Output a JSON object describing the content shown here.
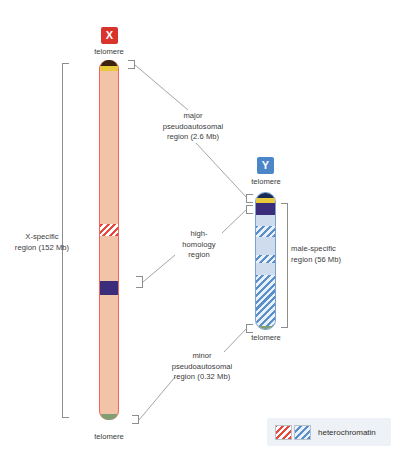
{
  "figure": {
    "title_x_badge": "X",
    "title_y_badge": "Y"
  },
  "labels": {
    "telomere": "telomere",
    "x_specific": "X-specific\nregion (152 Mb)",
    "major_pseudoautosomal": "major\npseudoautosomal\nregion (2.6 Mb)",
    "high_homology": "high-\nhomology\nregion",
    "minor_pseudoautosomal": "minor\npseudoautosomal\nregion (0.32 Mb)",
    "male_specific": "male-specific\nregion (56 Mb)"
  },
  "telomere_labels": {
    "x_top": "telomere",
    "x_bottom": "telomere",
    "y_top": "telomere",
    "y_bottom": "telomere"
  },
  "legend": {
    "text": "heterochromatin",
    "swatch_red_name": "red-hatch-swatch",
    "swatch_blue_name": "blue-hatch-swatch"
  },
  "colors": {
    "x_badge": "#d9342b",
    "y_badge": "#4a86c8",
    "x_body": "#f2c3a6",
    "x_outline": "#e8685f",
    "y_body": "#cfdcee",
    "y_outline": "#7ba2cf",
    "heterochromatin_red": "#e8473c",
    "heterochromatin_blue": "#5b8fc9",
    "dark_band": "#3b2d7a",
    "gold_band": "#e8c93c",
    "telomere_cap_dark": "#3a2410",
    "telomere_cap_green": "#7f9e74",
    "bracket": "#8d8d8d",
    "legend_bg": "#eef1f5"
  },
  "chromosomes": {
    "x": {
      "name": "X chromosome",
      "length_mb": 155,
      "bands": [
        {
          "name": "top-telomere-cap",
          "color": "#3a2410",
          "y_pct": 0,
          "h_pct": 1.6
        },
        {
          "name": "gold-band",
          "color": "#e8c93c",
          "y_pct": 1.6,
          "h_pct": 1.4
        },
        {
          "name": "heterochromatin-hatch",
          "color": "#e8473c",
          "y_pct": 45.5,
          "h_pct": 3.4
        },
        {
          "name": "dark-band",
          "color": "#3b2d7a",
          "y_pct": 61.5,
          "h_pct": 4.0
        },
        {
          "name": "bottom-telomere-cap",
          "color": "#7f9e74",
          "y_pct": 98.6,
          "h_pct": 1.4
        }
      ]
    },
    "y": {
      "name": "Y chromosome",
      "length_mb": 59,
      "bands": [
        {
          "name": "top-telomere-cap",
          "color": "#1a2a57",
          "y_pct": 0,
          "h_pct": 3.0
        },
        {
          "name": "gold-band",
          "color": "#e8c93c",
          "y_pct": 3.0,
          "h_pct": 3.4
        },
        {
          "name": "dark-band",
          "color": "#3b2d7a",
          "y_pct": 6.4,
          "h_pct": 8.5
        },
        {
          "name": "heterochromatin-hatch-1",
          "color": "#5b8fc9",
          "y_pct": 23.0,
          "h_pct": 7.5
        },
        {
          "name": "heterochromatin-hatch-2",
          "color": "#5b8fc9",
          "y_pct": 44.0,
          "h_pct": 5.0
        },
        {
          "name": "heterochromatin-hatch-3",
          "color": "#5b8fc9",
          "y_pct": 59.0,
          "h_pct": 38.0
        },
        {
          "name": "bottom-telomere-cap",
          "color": "#7f9e74",
          "y_pct": 97.0,
          "h_pct": 3.0
        }
      ]
    }
  }
}
